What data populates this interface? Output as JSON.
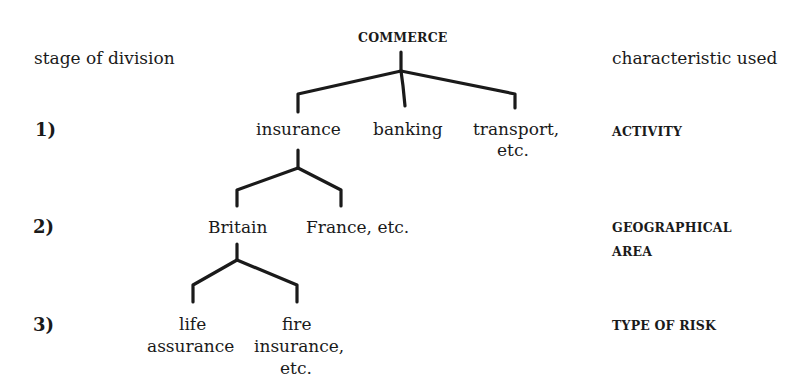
{
  "diagram": {
    "type": "hierarchy-tree",
    "header": {
      "left_label": "stage of division",
      "right_label": "characteristic used"
    },
    "root": "COMMERCE",
    "stages": [
      {
        "number": "1)",
        "characteristic": "ACTIVITY"
      },
      {
        "number": "2)",
        "characteristic_line1": "GEOGRAPHICAL",
        "characteristic_line2": "AREA"
      },
      {
        "number": "3)",
        "characteristic": "TYPE OF RISK"
      }
    ],
    "level1": {
      "insurance": "insurance",
      "banking": "banking",
      "transport_line1": "transport,",
      "transport_line2": "etc."
    },
    "level2": {
      "britain": "Britain",
      "france": "France, etc."
    },
    "level3": {
      "life_line1": "life",
      "life_line2": "assurance",
      "fire_line1": "fire",
      "fire_line2": "insurance,",
      "fire_line3": "etc."
    },
    "edges": [
      [
        "COMMERCE",
        "insurance"
      ],
      [
        "COMMERCE",
        "banking"
      ],
      [
        "COMMERCE",
        "transport, etc."
      ],
      [
        "insurance",
        "Britain"
      ],
      [
        "insurance",
        "France, etc."
      ],
      [
        "Britain",
        "life assurance"
      ],
      [
        "Britain",
        "fire insurance, etc."
      ]
    ]
  }
}
